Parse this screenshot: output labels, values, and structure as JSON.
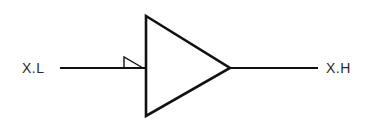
{
  "diagram": {
    "type": "buffer-amplifier-symbol",
    "input": {
      "label": "X.L"
    },
    "output": {
      "label": "X.H"
    },
    "component": {
      "shape": "triangle",
      "marker": "level-shift-flag-icon"
    },
    "colors": {
      "stroke": "#111111",
      "text": "#2a2a2a",
      "background": "#ffffff"
    }
  }
}
